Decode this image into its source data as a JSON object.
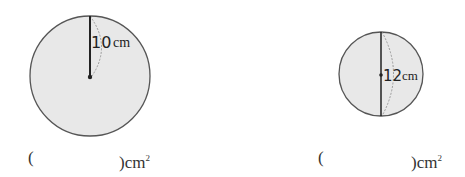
{
  "problems": [
    {
      "shape": "circle",
      "measurement_type": "radius",
      "value": "10",
      "unit": "cm",
      "answer_prefix": "(",
      "answer_suffix": ")cm",
      "answer_exponent": "2"
    },
    {
      "shape": "circle",
      "measurement_type": "diameter",
      "value": "12",
      "unit": "cm",
      "answer_prefix": "(",
      "answer_suffix": ")cm",
      "answer_exponent": "2"
    }
  ],
  "colors": {
    "circle_fill": "#e8e8e8",
    "circle_stroke": "#555555",
    "line": "#222222"
  }
}
